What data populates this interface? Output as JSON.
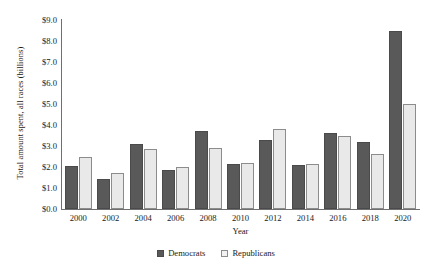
{
  "chart_data": {
    "type": "bar",
    "title": "",
    "xlabel": "Year",
    "ylabel": "Total amount spent, all races (billions)",
    "categories": [
      "2000",
      "2002",
      "2004",
      "2006",
      "2008",
      "2010",
      "2012",
      "2014",
      "2016",
      "2018",
      "2020"
    ],
    "series": [
      {
        "name": "Democrats",
        "color": "#595959",
        "values": [
          2.05,
          1.45,
          3.1,
          1.85,
          3.7,
          2.15,
          3.3,
          2.1,
          3.6,
          3.2,
          8.5
        ]
      },
      {
        "name": "Republicans",
        "color": "#e9e9e9",
        "values": [
          2.5,
          1.7,
          2.85,
          2.0,
          2.9,
          2.2,
          3.8,
          2.15,
          3.5,
          2.6,
          5.0
        ]
      }
    ],
    "ylim": [
      0,
      9
    ],
    "ytick_values": [
      9,
      8,
      7,
      6,
      5,
      4,
      3,
      2,
      1,
      0
    ],
    "ytick_labels": [
      "$9.0",
      "$8.0",
      "$7.0",
      "$6.0",
      "$5.0",
      "$4.0",
      "$3.0",
      "$2.0",
      "$1.0",
      "$0.0"
    ],
    "grid": false,
    "legend_position": "bottom",
    "legend": [
      "Democrats",
      "Republicans"
    ]
  }
}
